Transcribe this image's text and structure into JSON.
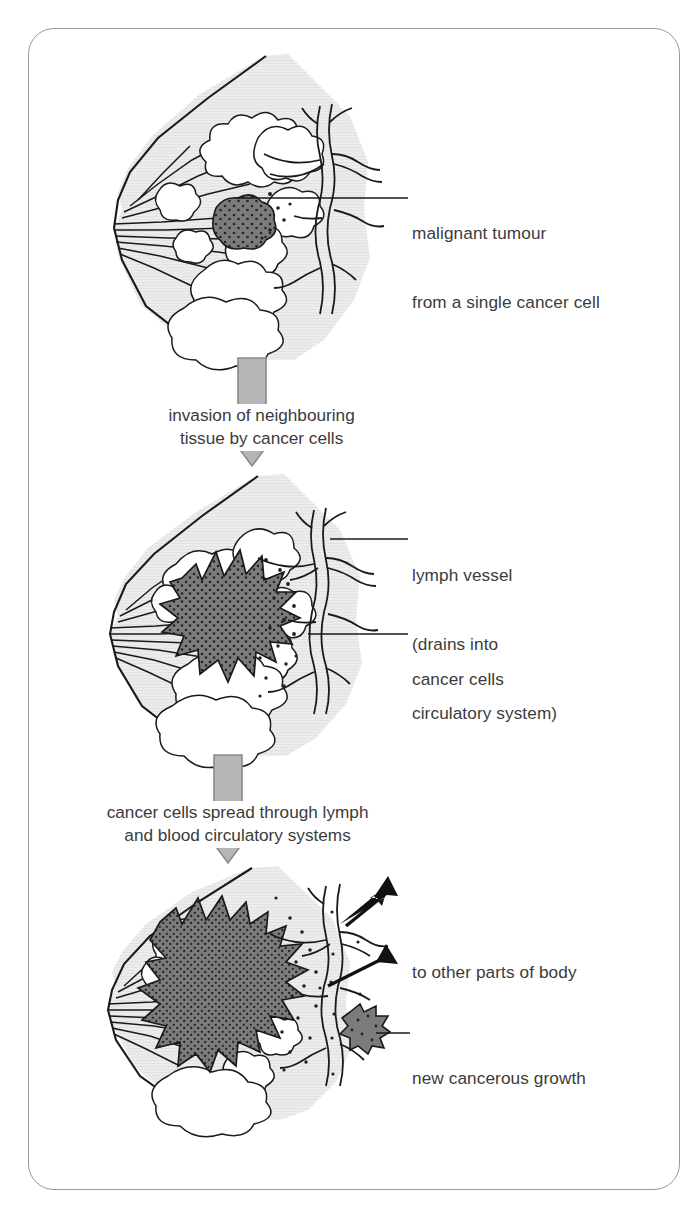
{
  "figure": {
    "title_alt": "Progression of breast cancer from malignant tumour to metastasis",
    "border_color": "#9a9a9a",
    "background": "#ffffff"
  },
  "colors": {
    "tissue_fill": "#e9e9e9",
    "tumour_fill": "#7b7b7b",
    "tumour_stipple": "#2b2b2b",
    "lobule_fill": "#ffffff",
    "outline": "#1a1a1a",
    "stage_arrow_fill": "#b6b6b6",
    "stage_arrow_stroke": "#8a8a8a",
    "spread_arrow_fill": "#111111",
    "text": "#3b3b3b",
    "leader_line": "#1a1a1a"
  },
  "panels": [
    {
      "id": "panel-1",
      "name": "breast-cross-section-stage-1",
      "labels": [
        {
          "name": "label-malignant-tumour",
          "lines": [
            "malignant tumour",
            "from a single cancer cell"
          ],
          "x": 412,
          "y": 176
        }
      ],
      "leaders": [
        {
          "name": "leader-malignant-tumour",
          "x1": 236,
          "y1": 198,
          "x2": 408,
          "y2": 198
        }
      ]
    },
    {
      "id": "panel-2",
      "name": "breast-cross-section-stage-2",
      "labels": [
        {
          "name": "label-lymph-vessel",
          "lines": [
            "lymph vessel",
            "(drains into",
            "circulatory system)"
          ],
          "x": 412,
          "y": 518
        },
        {
          "name": "label-cancer-cells",
          "lines": [
            "cancer cells"
          ],
          "x": 412,
          "y": 622
        }
      ],
      "leaders": [
        {
          "name": "leader-lymph-vessel",
          "x1": 330,
          "y1": 539,
          "x2": 408,
          "y2": 539
        },
        {
          "name": "leader-cancer-cells",
          "x1": 310,
          "y1": 633,
          "x2": 408,
          "y2": 633
        }
      ]
    },
    {
      "id": "panel-3",
      "name": "breast-cross-section-stage-3",
      "labels": [
        {
          "name": "label-to-other-parts-of-body",
          "lines": [
            "to other parts of body"
          ],
          "x": 412,
          "y": 915
        },
        {
          "name": "label-new-cancerous-growth",
          "lines": [
            "new cancerous growth"
          ],
          "x": 412,
          "y": 1021
        }
      ],
      "leaders": [
        {
          "name": "leader-new-cancerous-growth",
          "x1": 378,
          "y1": 1032,
          "x2": 408,
          "y2": 1032
        }
      ]
    }
  ],
  "stages": [
    {
      "name": "stage-arrow-invasion",
      "lines": [
        "invasion of neighbouring",
        "tissue by cancer cells"
      ],
      "arrow_top": 360,
      "arrow_height": 106,
      "center_x": 252
    },
    {
      "name": "stage-arrow-spread",
      "lines": [
        "cancer cells spread through lymph",
        "and blood circulatory systems"
      ],
      "arrow_top": 757,
      "arrow_height": 106,
      "center_x": 228
    }
  ],
  "anatomy": {
    "nipple": "nipple-and-ducts",
    "lobules": "milk-producing-lobules",
    "lymph_network": "lymph-vessel-branching-network",
    "tumour_stage_1": "small-round-malignant-tumour",
    "tumour_stage_2": "large-irregular-invasive-tumour",
    "tumour_stage_3": "extensive-tumour-with-metastasis",
    "secondary_growth": "small-star-shaped-new-growth"
  }
}
